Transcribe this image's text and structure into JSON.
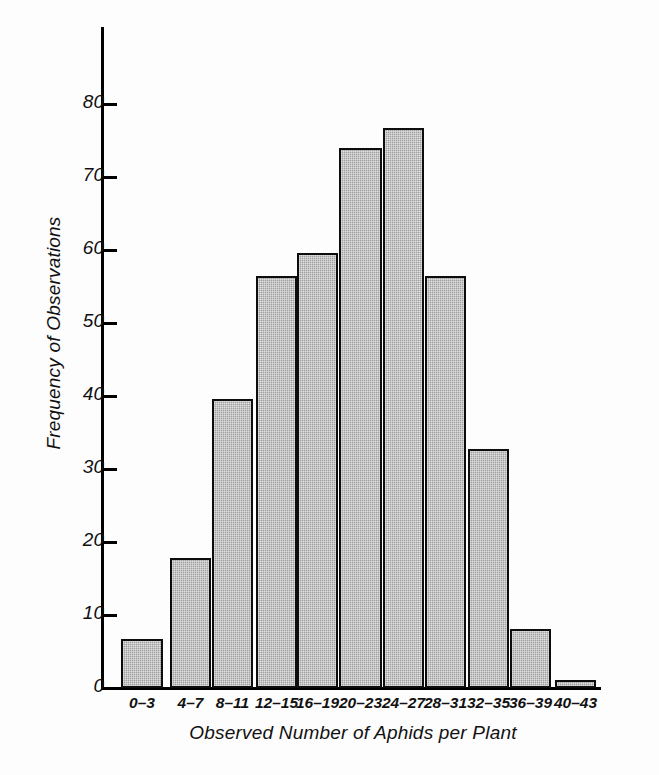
{
  "chart_data": {
    "type": "bar",
    "title": "",
    "subtitle": "",
    "xlabel": "Observed Number of Aphids per Plant",
    "ylabel": "Frequency of Observations",
    "categories": [
      "0–3",
      "4–7",
      "8–11",
      "12–15",
      "16–19",
      "20–23",
      "24–27",
      "28–31",
      "32–35",
      "36–39",
      "40–43"
    ],
    "values": [
      6.7,
      17.8,
      39.6,
      56.4,
      59.6,
      74.0,
      76.7,
      56.4,
      32.8,
      8.1,
      1.1
    ],
    "ylim": [
      0,
      88
    ],
    "yticks": [
      0,
      10,
      20,
      30,
      40,
      50,
      60,
      70,
      80
    ],
    "ytick_labels": [
      "0",
      "10",
      "20",
      "30",
      "40",
      "50",
      "60",
      "70",
      "80"
    ],
    "grid": false,
    "legend": null,
    "bar_fill": "#a9a9a9",
    "bar_edge": "#0d0d0d",
    "axis_color": "#000000",
    "background": "#ffffff"
  },
  "figure": {
    "caption": ""
  }
}
